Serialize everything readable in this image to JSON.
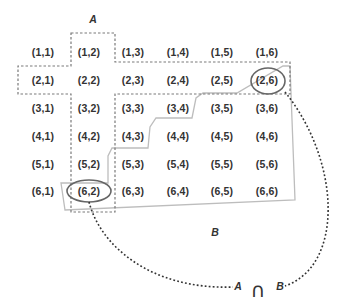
{
  "diagram": {
    "title_label_A": "A",
    "label_B": "B",
    "intersection": {
      "left": "A",
      "symbol": "∩",
      "right": "B"
    },
    "grid": [
      [
        "(1,1)",
        "(1,2)",
        "(1,3)",
        "(1,4)",
        "(1,5)",
        "(1,6)"
      ],
      [
        "(2,1)",
        "(2,2)",
        "(2,3)",
        "(2,4)",
        "(2,5)",
        "(2,6)"
      ],
      [
        "(3,1)",
        "(3,2)",
        "(3,3)",
        "(3,4)",
        "(3,5)",
        "(3,6)"
      ],
      [
        "(4,1)",
        "(4,2)",
        "(4,3)",
        "(4,4)",
        "(4,5)",
        "(4,6)"
      ],
      [
        "(5,1)",
        "(5,2)",
        "(5,3)",
        "(5,4)",
        "(5,5)",
        "(5,6)"
      ],
      [
        "(6,1)",
        "(6,2)",
        "(6,3)",
        "(6,4)",
        "(6,5)",
        "(6,6)"
      ]
    ],
    "highlighted_cells": [
      "(2,6)",
      "(6,2)"
    ],
    "colors": {
      "text": "#333333",
      "set_A_outline": "#777777",
      "set_B_outline": "#bbbbbb",
      "ellipse": "#666666",
      "connector": "#333333"
    }
  }
}
